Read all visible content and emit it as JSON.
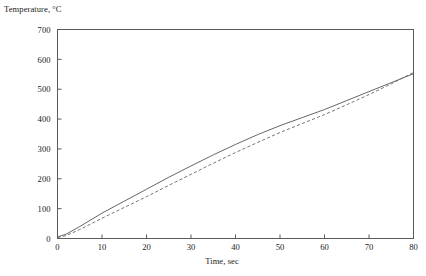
{
  "chart_data": {
    "type": "line",
    "title": "",
    "xlabel": "Time, sec",
    "ylabel": "Temperature, °C",
    "xlim": [
      0,
      80
    ],
    "ylim": [
      0,
      700
    ],
    "xticks": [
      0,
      10,
      20,
      30,
      40,
      50,
      60,
      70,
      80
    ],
    "xtick_labels": [
      "0",
      "10",
      "20",
      "30",
      "40",
      "50",
      "60",
      "70",
      "80"
    ],
    "yticks": [
      0,
      100,
      200,
      300,
      400,
      500,
      600,
      700
    ],
    "ytick_labels": [
      "0",
      "100",
      "200",
      "300",
      "400",
      "500",
      "600",
      "700"
    ],
    "grid": false,
    "legend": null,
    "legend_position": "none",
    "frame": "box",
    "tick_direction": "in",
    "line_color": "#444444",
    "series": [
      {
        "name": "solid-curve",
        "style": "solid",
        "color": "#555555",
        "x": [
          0,
          2,
          5,
          10,
          15,
          20,
          25,
          30,
          35,
          40,
          45,
          50,
          55,
          60,
          65,
          70,
          75,
          80
        ],
        "values": [
          5,
          15,
          40,
          85,
          125,
          165,
          205,
          243,
          280,
          315,
          348,
          378,
          405,
          432,
          462,
          492,
          522,
          552
        ]
      },
      {
        "name": "dashed-curve",
        "style": "dashed",
        "color": "#666666",
        "x": [
          0,
          2,
          5,
          10,
          15,
          20,
          25,
          30,
          35,
          40,
          45,
          50,
          55,
          60,
          65,
          70,
          75,
          80
        ],
        "values": [
          3,
          10,
          30,
          68,
          104,
          140,
          178,
          215,
          252,
          288,
          322,
          355,
          385,
          415,
          448,
          482,
          518,
          556
        ]
      }
    ]
  }
}
